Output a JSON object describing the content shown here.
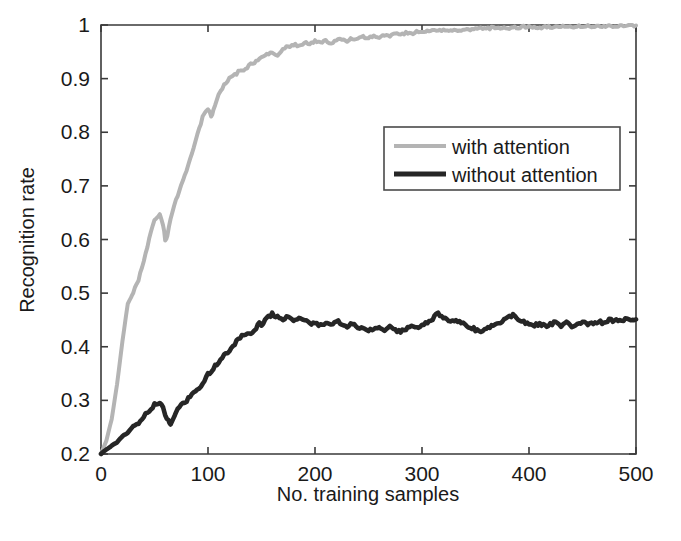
{
  "chart_data": {
    "type": "line",
    "title": "",
    "xlabel": "No. training samples",
    "ylabel": "Recognition rate",
    "xlim": [
      0,
      500
    ],
    "ylim": [
      0.2,
      1.0
    ],
    "xticks": [
      "0",
      "100",
      "200",
      "300",
      "400",
      "500"
    ],
    "xtick_values": [
      0,
      100,
      200,
      300,
      400,
      500
    ],
    "yticks": [
      "0.2",
      "0.3",
      "0.4",
      "0.5",
      "0.6",
      "0.7",
      "0.8",
      "0.9",
      "1"
    ],
    "ytick_values": [
      0.2,
      0.3,
      0.4,
      0.5,
      0.6,
      0.7,
      0.8,
      0.9,
      1.0
    ],
    "grid": false,
    "legend_position": "center-right-upper",
    "series": [
      {
        "name": "with attention",
        "color": "#b4b4b4",
        "width": 4.0,
        "x": [
          0,
          5,
          10,
          15,
          20,
          25,
          28,
          30,
          35,
          40,
          45,
          50,
          55,
          58,
          60,
          62,
          65,
          70,
          75,
          80,
          85,
          90,
          95,
          100,
          103,
          105,
          110,
          115,
          120,
          125,
          130,
          135,
          140,
          145,
          150,
          155,
          160,
          165,
          170,
          175,
          180,
          185,
          190,
          195,
          200,
          205,
          210,
          215,
          220,
          225,
          230,
          235,
          240,
          245,
          250,
          255,
          260,
          265,
          270,
          275,
          280,
          285,
          290,
          295,
          300,
          305,
          310,
          315,
          320,
          325,
          330,
          335,
          340,
          345,
          350,
          355,
          360,
          365,
          370,
          375,
          380,
          385,
          390,
          395,
          400,
          405,
          410,
          415,
          420,
          425,
          430,
          435,
          440,
          445,
          450,
          455,
          460,
          465,
          470,
          475,
          480,
          485,
          490,
          495,
          500
        ],
        "y": [
          0.2,
          0.225,
          0.265,
          0.33,
          0.41,
          0.48,
          0.492,
          0.5,
          0.525,
          0.56,
          0.6,
          0.637,
          0.645,
          0.628,
          0.6,
          0.605,
          0.64,
          0.672,
          0.7,
          0.73,
          0.762,
          0.795,
          0.828,
          0.845,
          0.83,
          0.84,
          0.87,
          0.888,
          0.9,
          0.907,
          0.915,
          0.918,
          0.928,
          0.932,
          0.938,
          0.944,
          0.948,
          0.944,
          0.956,
          0.96,
          0.963,
          0.962,
          0.967,
          0.965,
          0.97,
          0.968,
          0.971,
          0.966,
          0.972,
          0.974,
          0.97,
          0.975,
          0.973,
          0.978,
          0.976,
          0.98,
          0.978,
          0.982,
          0.98,
          0.984,
          0.982,
          0.986,
          0.984,
          0.987,
          0.985,
          0.988,
          0.99,
          0.988,
          0.991,
          0.989,
          0.992,
          0.99,
          0.993,
          0.991,
          0.992,
          0.994,
          0.992,
          0.995,
          0.993,
          0.995,
          0.994,
          0.996,
          0.995,
          0.997,
          0.996,
          0.997,
          0.995,
          0.997,
          0.996,
          0.998,
          0.996,
          0.998,
          0.997,
          0.998,
          0.997,
          0.999,
          0.997,
          0.999,
          0.998,
          0.999,
          0.998,
          0.999,
          0.998,
          1.0,
          0.999
        ]
      },
      {
        "name": "without attention",
        "color": "#262626",
        "width": 4.6,
        "x": [
          0,
          5,
          10,
          15,
          20,
          25,
          30,
          35,
          40,
          45,
          50,
          55,
          58,
          60,
          63,
          65,
          68,
          70,
          75,
          80,
          85,
          90,
          95,
          100,
          105,
          110,
          115,
          120,
          125,
          130,
          135,
          140,
          145,
          148,
          150,
          155,
          160,
          165,
          170,
          175,
          180,
          185,
          190,
          195,
          200,
          205,
          210,
          215,
          220,
          225,
          230,
          235,
          240,
          245,
          250,
          255,
          260,
          265,
          270,
          275,
          280,
          285,
          290,
          295,
          300,
          305,
          310,
          315,
          320,
          325,
          330,
          335,
          340,
          345,
          350,
          355,
          360,
          365,
          370,
          375,
          380,
          385,
          390,
          395,
          400,
          405,
          410,
          415,
          420,
          425,
          430,
          435,
          440,
          445,
          450,
          455,
          460,
          465,
          470,
          475,
          480,
          485,
          490,
          495,
          500
        ],
        "y": [
          0.2,
          0.208,
          0.215,
          0.222,
          0.233,
          0.24,
          0.252,
          0.258,
          0.27,
          0.28,
          0.292,
          0.295,
          0.288,
          0.272,
          0.262,
          0.258,
          0.268,
          0.28,
          0.29,
          0.3,
          0.312,
          0.322,
          0.33,
          0.348,
          0.36,
          0.372,
          0.385,
          0.392,
          0.405,
          0.418,
          0.425,
          0.422,
          0.436,
          0.445,
          0.442,
          0.452,
          0.462,
          0.455,
          0.452,
          0.455,
          0.45,
          0.452,
          0.448,
          0.445,
          0.443,
          0.44,
          0.445,
          0.44,
          0.448,
          0.444,
          0.438,
          0.442,
          0.436,
          0.432,
          0.43,
          0.434,
          0.438,
          0.432,
          0.436,
          0.43,
          0.428,
          0.432,
          0.438,
          0.434,
          0.44,
          0.446,
          0.452,
          0.462,
          0.455,
          0.45,
          0.446,
          0.448,
          0.442,
          0.436,
          0.432,
          0.43,
          0.434,
          0.438,
          0.442,
          0.448,
          0.454,
          0.458,
          0.452,
          0.446,
          0.444,
          0.44,
          0.443,
          0.438,
          0.442,
          0.446,
          0.44,
          0.444,
          0.438,
          0.442,
          0.446,
          0.44,
          0.444,
          0.448,
          0.444,
          0.45,
          0.448,
          0.452,
          0.45,
          0.452,
          0.451
        ]
      }
    ],
    "legend": {
      "entries": [
        {
          "label": "with attention",
          "color": "#b4b4b4"
        },
        {
          "label": "without attention",
          "color": "#262626"
        }
      ]
    }
  }
}
